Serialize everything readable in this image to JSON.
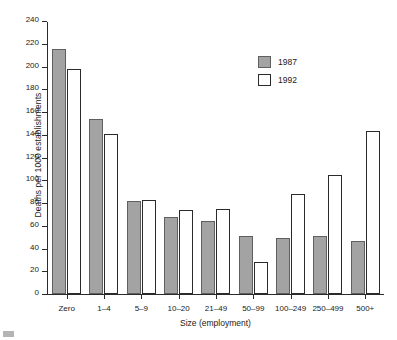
{
  "chart_data": {
    "type": "bar",
    "title": "",
    "xlabel": "Size (employment)",
    "ylabel": "Deaths per 1000 establishments",
    "categories": [
      "Zero",
      "1–4",
      "5–9",
      "10–20",
      "21–49",
      "50–99",
      "100–249",
      "250–499",
      "500+"
    ],
    "series": [
      {
        "name": "1987",
        "color": "#a3a3a3",
        "values": [
          215,
          154,
          82,
          68,
          64,
          51,
          49,
          51,
          47
        ]
      },
      {
        "name": "1992",
        "color": "#ffffff",
        "values": [
          198,
          141,
          83,
          74,
          75,
          28,
          88,
          105,
          143
        ]
      }
    ],
    "ylim": [
      0,
      240
    ],
    "yticks": [
      0,
      20,
      40,
      60,
      80,
      100,
      120,
      140,
      160,
      180,
      200,
      220,
      240
    ],
    "ytick_labels": [
      "0",
      "20",
      "40",
      "60",
      "80",
      "100",
      "120",
      "140",
      "160",
      "180",
      "200",
      "220",
      "240"
    ],
    "grid": false,
    "legend_position": "upper-right-inside"
  }
}
